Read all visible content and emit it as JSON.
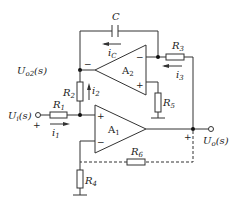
{
  "diagram": {
    "type": "circuit",
    "components": {
      "C": {
        "label": "C"
      },
      "iC": {
        "main": "i",
        "sub": "C"
      },
      "R1": {
        "main": "R",
        "sub": "1"
      },
      "R2": {
        "main": "R",
        "sub": "2"
      },
      "R3": {
        "main": "R",
        "sub": "3"
      },
      "R4": {
        "main": "R",
        "sub": "4"
      },
      "R5": {
        "main": "R",
        "sub": "5"
      },
      "R6": {
        "main": "R",
        "sub": "6"
      },
      "A1": {
        "main": "A",
        "sub": "1"
      },
      "A2": {
        "main": "A",
        "sub": "2"
      },
      "i1": {
        "main": "i",
        "sub": "1"
      },
      "i2": {
        "main": "i",
        "sub": "2"
      },
      "i3": {
        "main": "i",
        "sub": "3"
      }
    },
    "nodes": {
      "Uo2": {
        "main": "U",
        "sub": "o2",
        "suffix": "(s)"
      },
      "Ui": {
        "main": "U",
        "sub": "i",
        "suffix": "(s)"
      },
      "Uo": {
        "main": "U",
        "sub": "o",
        "suffix": "(s)"
      }
    },
    "signs": {
      "minus": "−",
      "plus": "+"
    }
  }
}
